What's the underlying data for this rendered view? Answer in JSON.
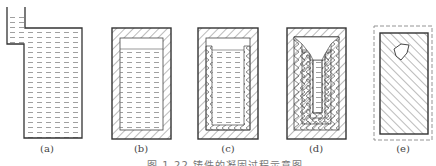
{
  "figure": {
    "caption": "图 1-22  铸件的凝固过程示意图",
    "panels": [
      {
        "id": "a",
        "label": "(a)",
        "description": "mold filled with liquid metal, with riser"
      },
      {
        "id": "b",
        "label": "(b)",
        "description": "thin solidified shell forms at mold wall"
      },
      {
        "id": "c",
        "label": "(c)",
        "description": "shell thickens, liquid level drops"
      },
      {
        "id": "d",
        "label": "(d)",
        "description": "layered solidification, narrowing liquid core"
      },
      {
        "id": "e",
        "label": "(e)",
        "description": "fully solidified casting with shrinkage cavity, dashed outline shows original size"
      }
    ]
  },
  "colors": {
    "line": "#333333",
    "hatch": "#555555",
    "liquid_dash": "#777777",
    "dashed_outline": "#888888"
  }
}
